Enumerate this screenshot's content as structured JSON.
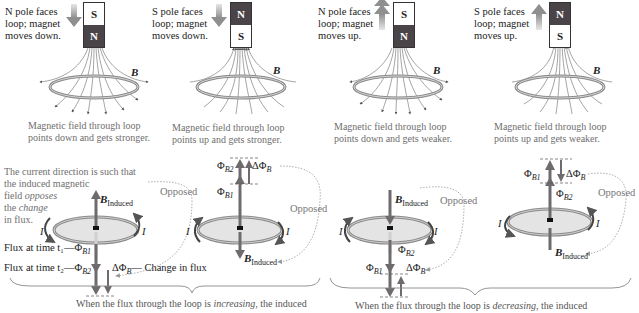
{
  "panels": [
    {
      "label_lines": [
        "N pole faces",
        "loop; magnet",
        "moves down."
      ],
      "magnet": {
        "top": "S",
        "bottom": "N"
      },
      "motion": "down",
      "field_label": "B",
      "caption_lines": [
        "Magnetic field through loop",
        "points down and gets stronger."
      ]
    },
    {
      "label_lines": [
        "S pole faces",
        "loop; magnet",
        "moves down."
      ],
      "magnet": {
        "top": "N",
        "bottom": "S"
      },
      "motion": "down",
      "field_label": "B",
      "caption_lines": [
        "Magnetic field through loop",
        "points up and gets stronger."
      ]
    },
    {
      "label_lines": [
        "N pole faces",
        "loop; magnet",
        "moves up."
      ],
      "magnet": {
        "top": "S",
        "bottom": "N"
      },
      "motion": "up",
      "field_label": "B",
      "caption_lines": [
        "Magnetic field through loop",
        "points down and gets weaker."
      ]
    },
    {
      "label_lines": [
        "S pole faces",
        "loop; magnet",
        "moves up."
      ],
      "magnet": {
        "top": "N",
        "bottom": "S"
      },
      "motion": "up",
      "field_label": "B",
      "caption_lines": [
        "Magnetic field through loop",
        "points up and gets weaker."
      ]
    }
  ],
  "explanation": {
    "line1": "The current direction is such that",
    "line2": "the induced magnetic",
    "line3_pre": "field ",
    "line3_em": "opposes",
    "line4_pre": "the ",
    "line4_em": "change",
    "line5": "in flux."
  },
  "flux_labels": {
    "t1": "Flux at time t₁—Φ",
    "t1_sub": "B1",
    "t2": "Flux at time t₂—Φ",
    "t2_sub": "B2",
    "delta": "ΔΦ",
    "delta_sub": "B",
    "change": "— Change in flux"
  },
  "symbols": {
    "b_induced": "B",
    "b_induced_sub": "Induced",
    "current": "I",
    "phi": "Φ",
    "phi_b1_sub": "B1",
    "phi_b2_sub": "B2",
    "delta_phi": "ΔΦ",
    "delta_phi_sub": "B",
    "opposed": "Opposed"
  },
  "bottom_text": {
    "increasing_pre": "When the flux through the loop is ",
    "increasing_em": "increasing",
    "increasing_post": ", the induced",
    "decreasing_pre": "When the flux through the loop is ",
    "decreasing_em": "decreasing",
    "decreasing_post": ", the induced"
  },
  "colors": {
    "magnet_n": "#4a4448",
    "magnet_s": "#ffffff",
    "ring": "#8a8a8a",
    "ring_fill": "#e4e4e4",
    "flux_arrow": "#6f6a6e",
    "motion_arrow": "#9a9a9a",
    "caption_text": "#6e6e6e",
    "opposed_dots": "#999999"
  }
}
